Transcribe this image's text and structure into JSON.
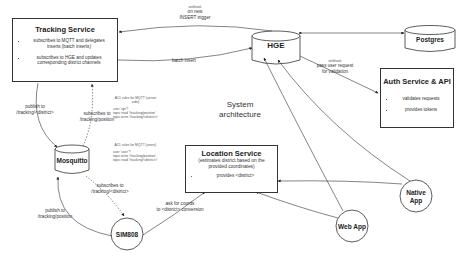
{
  "diagram": {
    "caption": {
      "line1": "System",
      "line2": "architecture"
    },
    "tracking_service": {
      "title": "Tracking Service",
      "bullets": [
        "subscribes to MQTT and delegates inserts (batch inserts)",
        "subscribes to HGE and updates corresponding district channels"
      ]
    },
    "auth_service": {
      "title": "Auth Service & API",
      "bullets": [
        "validates requests",
        "provides tokens"
      ]
    },
    "location_service": {
      "title": "Location Service",
      "subtitle": "(estimates district based on the provided coordinates)",
      "bullets": [
        "provides <district>"
      ]
    },
    "nodes": {
      "hge": "HGE",
      "postgres": "Postgres",
      "mosquitto": "Mosquitto",
      "sim808": "SIM808",
      "web_app": "Web App",
      "native_app": "Native App"
    },
    "edges": {
      "insert_trigger": {
        "tag": "webhook",
        "line1": "on new",
        "line2": "INSERT trigger"
      },
      "batch_insert": "batch insert",
      "pass_request": {
        "tag": "webhook",
        "line1": "pass user request",
        "line2": "for validation"
      },
      "ts_publish": {
        "line1": "publish to",
        "line2": "/tracking/<district>"
      },
      "ts_subscribe": {
        "line1": "subscribes to",
        "line2": "/tracking/position"
      },
      "sim_subscribe": {
        "line1": "subscribes to",
        "line2": "/tracking/<district>"
      },
      "sim_publish": {
        "line1": "publish to",
        "line2": "/tracking/position"
      },
      "ask_coords": {
        "line1": "ask for coords",
        "line2": "to <district> conversion"
      }
    },
    "acl_server": {
      "header1": "ACL rules for MQTT (server",
      "header2": "side)",
      "user": "user 'api'?",
      "read": "topic read '/tracking/position'",
      "write": "topic write '/tracking/<district>'"
    },
    "acl_users": {
      "header": "ACL rules for MQTT (users)",
      "user": "user 'user'?",
      "write": "topic write '/tracking/position'",
      "read": "topic read '/tracking/<district>'"
    }
  }
}
